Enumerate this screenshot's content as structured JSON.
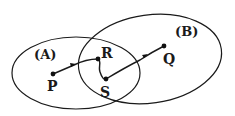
{
  "diagram": {
    "sets": [
      {
        "id": "A",
        "label": "(A)"
      },
      {
        "id": "B",
        "label": "(B)"
      }
    ],
    "points": [
      {
        "id": "P",
        "label": "P"
      },
      {
        "id": "R",
        "label": "R"
      },
      {
        "id": "S",
        "label": "S"
      },
      {
        "id": "Q",
        "label": "Q"
      }
    ],
    "path": {
      "sequence": [
        "P",
        "R",
        "S",
        "Q"
      ],
      "directed": true
    }
  }
}
